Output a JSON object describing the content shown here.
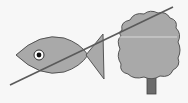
{
  "diagram": {
    "colors": {
      "background": "#f7f7f7",
      "fill": "#a9a9a9",
      "outline": "#555555",
      "trunk": "#6b6b6b",
      "line": "#5a5a5a",
      "highlight": "#d0d0d0",
      "eye_white": "#ffffff",
      "eye_pupil": "#111111"
    },
    "objects": [
      {
        "name": "fish",
        "parts": [
          "body",
          "tail",
          "eye"
        ]
      },
      {
        "name": "tree",
        "parts": [
          "crown",
          "trunk"
        ]
      },
      {
        "name": "diagonal-line",
        "from": [
          10,
          85
        ],
        "to": [
          173,
          7
        ]
      }
    ]
  }
}
